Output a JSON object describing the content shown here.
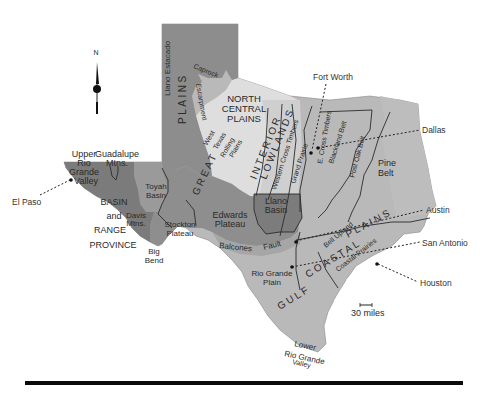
{
  "map": {
    "title": "Physiographic Regions of Texas",
    "colors": {
      "background": "#ffffff",
      "high_plains": "#8a8a8a",
      "basin_range": "#7a7a7a",
      "edwards_plateau": "#8e8e8e",
      "north_central": "#dcdcdc",
      "interior_lowlands": "#c6c6c6",
      "coastal_plains": "#b8b8b8",
      "llano_basin": "#7c7c7c",
      "line": "#222222"
    },
    "compass": {
      "label": "N"
    },
    "scale": {
      "label": "30 miles"
    },
    "regions": {
      "llano_estacado": "Llano Estacado",
      "caprock": "Caprock",
      "escarpment": "Escarpment",
      "plains": "PLAINS",
      "great": "GREAT",
      "north_central_1": "NORTH",
      "north_central_2": "CENTRAL",
      "north_central_3": "PLAINS",
      "west_texas_1": "West",
      "west_texas_2": "Texas",
      "west_texas_3": "Rolling",
      "west_texas_4": "Plains",
      "interior": "INTERIOR",
      "lowlands": "LOWLANDS",
      "western_cross_timbers": "Western Cross Timbers",
      "grand_prairie": "Grand Prairie",
      "e_cross_timbers": "E. Cross Timbers",
      "blackland_belt": "Blackland Belt",
      "post_oak_belt": "Post Oak Belt",
      "pine_belt_1": "Pine",
      "pine_belt_2": "Belt",
      "upper_rio_1": "Upper",
      "upper_rio_2": "Rio",
      "upper_rio_3": "Grande",
      "upper_rio_4": "Valley",
      "guadalupe_1": "Guadalupe",
      "guadalupe_2": "Mtns.",
      "toyah_1": "Toyah",
      "toyah_2": "Basin",
      "basin_1": "BASIN",
      "basin_2": "and",
      "basin_3": "RANGE",
      "basin_4": "PROVINCE",
      "davis_1": "Davis",
      "davis_2": "Mtns.",
      "stockton_1": "Stockton",
      "stockton_2": "Plateau",
      "big_bend_1": "Big",
      "big_bend_2": "Bend",
      "edwards_1": "Edwards",
      "edwards_2": "Plateau",
      "llano_1": "Llano",
      "llano_2": "Basin",
      "balcones": "Balcones",
      "fault": "Fault",
      "rio_grande_plain_1": "Rio Grande",
      "rio_grande_plain_2": "Plain",
      "gulf": "GULF",
      "coastal": "COASTAL",
      "plains_coast": "PLAINS",
      "coastal_prairies": "Coastal Prairies",
      "san_antonio_upland": "Bell Upland",
      "lower_rio_1": "Lower",
      "lower_rio_2": "Rio Grande",
      "lower_rio_3": "Valley"
    },
    "cities": {
      "el_paso": "El Paso",
      "fort_worth": "Fort Worth",
      "dallas": "Dallas",
      "austin": "Austin",
      "san_antonio": "San Antonio",
      "houston": "Houston"
    }
  }
}
